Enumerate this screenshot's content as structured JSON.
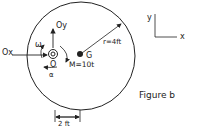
{
  "figure": {
    "caption": "Figure b",
    "labels": {
      "ox": "Ox",
      "oy": "Oy",
      "omega": "ω",
      "pivot": "O",
      "alpha": "α",
      "center": "G",
      "moment": "M=10t",
      "radius": "r=4ft",
      "dimension": "2 ft"
    },
    "axes": {
      "y": "y",
      "x": "x"
    }
  }
}
